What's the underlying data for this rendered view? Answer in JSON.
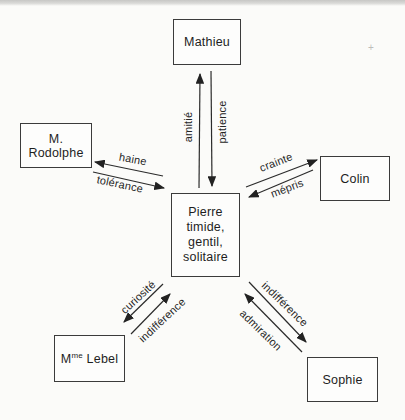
{
  "diagram": {
    "nodes": {
      "mathieu": {
        "label": "Mathieu"
      },
      "rodolphe": {
        "label": "M. Rodolphe"
      },
      "colin": {
        "label": "Colin"
      },
      "sophie": {
        "label": "Sophie"
      },
      "lebel": {
        "prefix": "M",
        "superscript": "me",
        "surname": " Lebel"
      },
      "pierre": {
        "lines": [
          "Pierre",
          "timide,",
          "gentil,",
          "solitaire"
        ]
      }
    },
    "relations": {
      "amitie": {
        "label": "amitié",
        "from": "Pierre",
        "to": "Mathieu"
      },
      "patience": {
        "label": "patience",
        "from": "Mathieu",
        "to": "Pierre"
      },
      "haine": {
        "label": "haine",
        "from": "Pierre",
        "to": "M. Rodolphe"
      },
      "tolerance": {
        "label": "tolérance",
        "from": "M. Rodolphe",
        "to": "Pierre"
      },
      "crainte": {
        "label": "crainte",
        "from": "Pierre",
        "to": "Colin"
      },
      "mepris": {
        "label": "mépris",
        "from": "Colin",
        "to": "Pierre"
      },
      "curiosite": {
        "label": "curiosité",
        "from": "Pierre",
        "to": "Mme Lebel"
      },
      "indifference_lebel": {
        "label": "indifférence",
        "from": "Mme Lebel",
        "to": "Pierre"
      },
      "indifference_sophie": {
        "label": "indifférence",
        "from": "Pierre",
        "to": "Sophie"
      },
      "admiration": {
        "label": "admiration",
        "from": "Sophie",
        "to": "Pierre"
      }
    },
    "artifacts": {
      "registration_mark": "+"
    },
    "colors": {
      "line": "#2b2b2b",
      "box_border": "#3b3b3b",
      "background": "#fbfbf9"
    }
  }
}
